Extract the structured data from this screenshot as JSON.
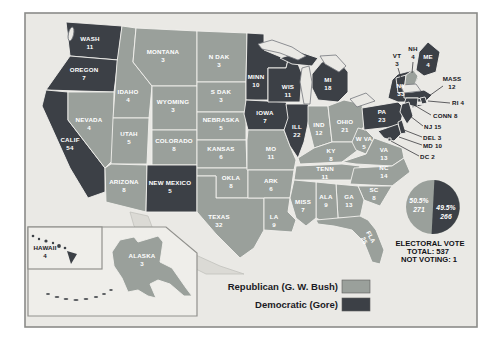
{
  "colors": {
    "republican": "#9aa09b",
    "democratic": "#3c4046"
  },
  "legend": {
    "republican": "Republican (G. W. Bush)",
    "democratic": "Democratic (Gore)"
  },
  "summary": {
    "title": "ELECTORAL VOTE",
    "total": "TOTAL: 537",
    "not_voting": "NOT VOTING: 1"
  },
  "pie": {
    "republican_pct": "50.5%",
    "republican_votes": "271",
    "democratic_pct": "49.5%",
    "democratic_votes": "266"
  },
  "states": [
    {
      "id": "WA",
      "name": "WASH",
      "votes": "11",
      "party": "D"
    },
    {
      "id": "OR",
      "name": "OREGON",
      "votes": "7",
      "party": "D"
    },
    {
      "id": "CA",
      "name": "CALIF",
      "votes": "54",
      "party": "D"
    },
    {
      "id": "NV",
      "name": "NEVADA",
      "votes": "4",
      "party": "R"
    },
    {
      "id": "ID",
      "name": "IDAHO",
      "votes": "4",
      "party": "R"
    },
    {
      "id": "MT",
      "name": "MONTANA",
      "votes": "3",
      "party": "R"
    },
    {
      "id": "WY",
      "name": "WYOMING",
      "votes": "3",
      "party": "R"
    },
    {
      "id": "UT",
      "name": "UTAH",
      "votes": "5",
      "party": "R"
    },
    {
      "id": "CO",
      "name": "COLORADO",
      "votes": "8",
      "party": "R"
    },
    {
      "id": "AZ",
      "name": "ARIZONA",
      "votes": "8",
      "party": "R"
    },
    {
      "id": "NM",
      "name": "NEW MEXICO",
      "votes": "5",
      "party": "D"
    },
    {
      "id": "ND",
      "name": "N DAK",
      "votes": "3",
      "party": "R"
    },
    {
      "id": "SD",
      "name": "S DAK",
      "votes": "3",
      "party": "R"
    },
    {
      "id": "NE",
      "name": "NEBRASKA",
      "votes": "5",
      "party": "R"
    },
    {
      "id": "KS",
      "name": "KANSAS",
      "votes": "6",
      "party": "R"
    },
    {
      "id": "OK",
      "name": "OKLA",
      "votes": "8",
      "party": "R"
    },
    {
      "id": "TX",
      "name": "TEXAS",
      "votes": "32",
      "party": "R"
    },
    {
      "id": "MN",
      "name": "MINN",
      "votes": "10",
      "party": "D"
    },
    {
      "id": "IA",
      "name": "IOWA",
      "votes": "7",
      "party": "D"
    },
    {
      "id": "MO",
      "name": "MO",
      "votes": "11",
      "party": "R"
    },
    {
      "id": "AR",
      "name": "ARK",
      "votes": "6",
      "party": "R"
    },
    {
      "id": "LA",
      "name": "LA",
      "votes": "9",
      "party": "R"
    },
    {
      "id": "WI",
      "name": "WIS",
      "votes": "11",
      "party": "D"
    },
    {
      "id": "IL",
      "name": "ILL",
      "votes": "22",
      "party": "D"
    },
    {
      "id": "MS",
      "name": "MISS",
      "votes": "7",
      "party": "R"
    },
    {
      "id": "MI",
      "name": "MI",
      "votes": "18",
      "party": "D"
    },
    {
      "id": "IN",
      "name": "IND",
      "votes": "12",
      "party": "R"
    },
    {
      "id": "OH",
      "name": "OHIO",
      "votes": "21",
      "party": "R"
    },
    {
      "id": "KY",
      "name": "KY",
      "votes": "8",
      "party": "R"
    },
    {
      "id": "TN",
      "name": "TENN",
      "votes": "11",
      "party": "R"
    },
    {
      "id": "WV",
      "name": "W VA",
      "votes": "5",
      "party": "R"
    },
    {
      "id": "VA",
      "name": "VA",
      "votes": "13",
      "party": "R"
    },
    {
      "id": "NC",
      "name": "NC",
      "votes": "14",
      "party": "R"
    },
    {
      "id": "SC",
      "name": "SC",
      "votes": "8",
      "party": "R"
    },
    {
      "id": "GA",
      "name": "GA",
      "votes": "13",
      "party": "R"
    },
    {
      "id": "AL",
      "name": "ALA",
      "votes": "9",
      "party": "R"
    },
    {
      "id": "FL",
      "name": "FLA",
      "votes": "25",
      "party": "R"
    },
    {
      "id": "PA",
      "name": "PA",
      "votes": "23",
      "party": "D"
    },
    {
      "id": "NY",
      "name": "NY",
      "votes": "33",
      "party": "D"
    },
    {
      "id": "VT",
      "name": "VT",
      "votes": "3",
      "party": "D"
    },
    {
      "id": "NH",
      "name": "NH",
      "votes": "4",
      "party": "R"
    },
    {
      "id": "ME",
      "name": "ME",
      "votes": "4",
      "party": "D"
    },
    {
      "id": "MA",
      "name": "MASS",
      "votes": "12",
      "party": "D"
    },
    {
      "id": "RI",
      "name": "RI",
      "votes": "4",
      "party": "D"
    },
    {
      "id": "CT",
      "name": "CONN",
      "votes": "8",
      "party": "D"
    },
    {
      "id": "NJ",
      "name": "NJ",
      "votes": "15",
      "party": "D"
    },
    {
      "id": "DE",
      "name": "DEL",
      "votes": "3",
      "party": "D"
    },
    {
      "id": "MD",
      "name": "MD",
      "votes": "10",
      "party": "D"
    },
    {
      "id": "DC",
      "name": "DC",
      "votes": "2",
      "party": "D"
    },
    {
      "id": "AK",
      "name": "ALASKA",
      "votes": "3",
      "party": "R"
    },
    {
      "id": "HI",
      "name": "HAWAII",
      "votes": "4",
      "party": "D"
    }
  ]
}
